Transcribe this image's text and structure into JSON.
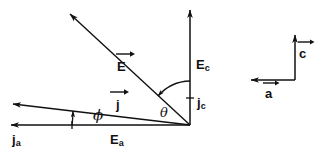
{
  "figure": {
    "kind": "vector-phasor-diagram",
    "background_color": "#ffffff",
    "ink_color": "#111111",
    "width": 319,
    "height": 155
  },
  "labels": {
    "e_vector": {
      "symbol": "E",
      "overline_arrow": "right",
      "role": "electric-field-vector"
    },
    "j_vector": {
      "symbol": "j",
      "overline_arrow": "right",
      "role": "current-density-vector"
    },
    "e_c": {
      "symbol": "E",
      "subscript": "c",
      "role": "field-component-c-axis"
    },
    "e_a": {
      "symbol": "E",
      "subscript": "a",
      "role": "field-component-a-axis"
    },
    "j_c": {
      "symbol": "j",
      "subscript": "c",
      "role": "current-component-c-axis"
    },
    "j_a": {
      "symbol": "j",
      "subscript": "a",
      "role": "current-component-a-axis"
    },
    "theta": {
      "symbol": "θ",
      "role": "angle-between-E-and-c-axis"
    },
    "phi": {
      "symbol": "ϕ",
      "role": "angle-between-j-and-a-axis"
    },
    "axis_c": {
      "symbol": "c",
      "overline_arrow": "right",
      "role": "crystal-axis-c"
    },
    "axis_a": {
      "symbol": "a",
      "overline_arrow": "right",
      "role": "crystal-axis-a"
    }
  },
  "geometry": {
    "origin": {
      "x": 190,
      "y": 125
    },
    "vertical_axis_top": {
      "x": 190,
      "y": 8
    },
    "horizontal_axis_left": {
      "x": 8,
      "y": 125
    },
    "e_vector_tip": {
      "x": 68,
      "y": 12
    },
    "j_vector_tip": {
      "x": 10,
      "y": 104
    },
    "theta_arc_radius": 44,
    "phi_arc_radius": 118,
    "inset": {
      "corner": {
        "x": 295,
        "y": 80
      },
      "c_axis_top": {
        "x": 295,
        "y": 33
      },
      "a_axis_left": {
        "x": 249,
        "y": 80
      }
    }
  }
}
